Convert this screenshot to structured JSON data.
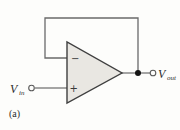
{
  "figure": {
    "type": "circuit-diagram",
    "caption": "(a)",
    "labels": {
      "input_main": "V",
      "input_sub": "in",
      "output_main": "V",
      "output_sub": "out"
    },
    "opamp": {
      "inverting_label": "−",
      "noninverting_label": "+"
    },
    "colors": {
      "background": "#fdfdfb",
      "wire": "#6a6a6a",
      "triangle_fill": "#e9e7e2",
      "triangle_stroke": "#3f3f3f",
      "junction_dot": "#141414",
      "terminal_stroke": "#5a5a5a",
      "text": "#2b2b2b"
    }
  }
}
